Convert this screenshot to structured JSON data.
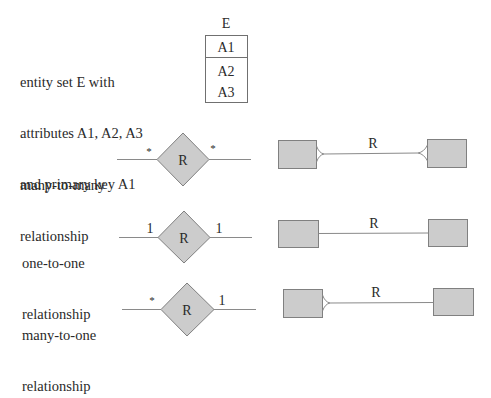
{
  "entity_section": {
    "description_lines": [
      "entity set E with",
      "attributes A1, A2, A3",
      "and primary key A1"
    ],
    "entity_name": "E",
    "primary_key": "A1",
    "attributes": [
      "A2",
      "A3"
    ]
  },
  "rows": [
    {
      "description_lines": [
        "many-to-many",
        "relationship"
      ],
      "relationship_label": "R",
      "left_cardinality": "*",
      "right_cardinality": "*",
      "crowsfoot_label": "R"
    },
    {
      "description_lines": [
        "one-to-one",
        "relationship"
      ],
      "relationship_label": "R",
      "left_cardinality": "1",
      "right_cardinality": "1",
      "crowsfoot_label": "R"
    },
    {
      "description_lines": [
        "many-to-one",
        "relationship"
      ],
      "relationship_label": "R",
      "left_cardinality": "*",
      "right_cardinality": "1",
      "crowsfoot_label": "R"
    }
  ],
  "colors": {
    "shape_fill": "#cccccc",
    "stroke": "#707070",
    "text": "#2a2a2a"
  }
}
